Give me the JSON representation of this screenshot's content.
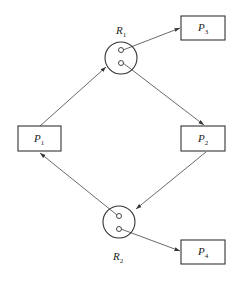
{
  "diagram": {
    "type": "resource-allocation-graph",
    "processes": [
      {
        "id": "P1",
        "label": "P",
        "sub": "1",
        "x": 18,
        "y": 126,
        "w": 43,
        "h": 25
      },
      {
        "id": "P2",
        "label": "P",
        "sub": "2",
        "x": 181,
        "y": 126,
        "w": 44,
        "h": 25
      },
      {
        "id": "P3",
        "label": "P",
        "sub": "3",
        "x": 181,
        "y": 16,
        "w": 44,
        "h": 24
      },
      {
        "id": "P4",
        "label": "P",
        "sub": "4",
        "x": 181,
        "y": 240,
        "w": 44,
        "h": 24
      }
    ],
    "resources": [
      {
        "id": "R1",
        "label": "R",
        "sub": "1",
        "cx": 121,
        "cy": 58,
        "r": 16,
        "instances": 2,
        "label_x": 118,
        "label_y": 33
      },
      {
        "id": "R2",
        "label": "R",
        "sub": "2",
        "cx": 119,
        "cy": 222,
        "r": 16,
        "instances": 2,
        "label_x": 114,
        "label_y": 262
      }
    ],
    "edges": [
      {
        "from": "P1",
        "to": "R1",
        "kind": "request"
      },
      {
        "from": "R1",
        "to": "P3",
        "kind": "assignment"
      },
      {
        "from": "R1",
        "to": "P2",
        "kind": "assignment"
      },
      {
        "from": "P2",
        "to": "R2",
        "kind": "request"
      },
      {
        "from": "R2",
        "to": "P1",
        "kind": "assignment"
      },
      {
        "from": "R2",
        "to": "P4",
        "kind": "assignment"
      }
    ],
    "colors": {
      "stroke": "#333333",
      "background": "#ffffff"
    }
  }
}
